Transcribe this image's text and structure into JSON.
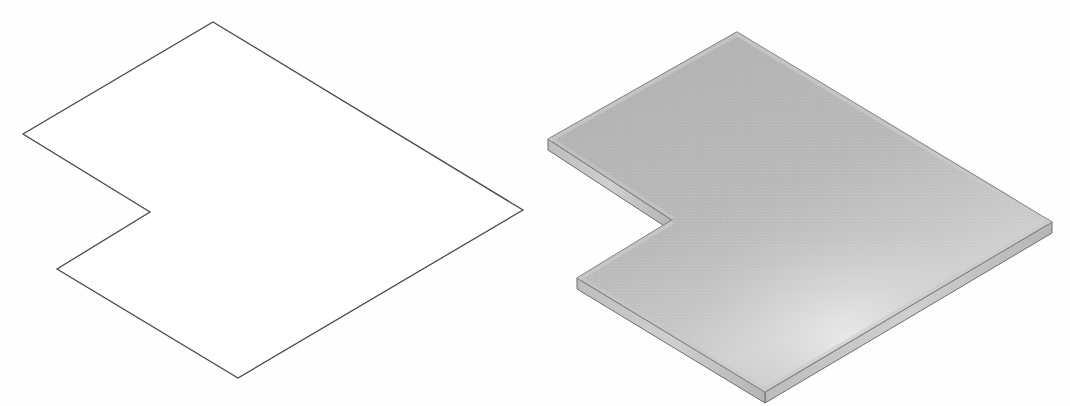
{
  "document": {
    "title": "L-shaped notched plate — outline and solid isometric views",
    "background_color": "#fefefe",
    "width": 1070,
    "height": 406
  },
  "figures": [
    {
      "id": "outline-view",
      "name": "wireframe-outline-plate",
      "caption": "",
      "render": "outline",
      "stroke_color": "#4a4a4a",
      "fill_color": "#ffffff",
      "stroke_width": 1.3,
      "vertices": [
        [
          213,
          22
        ],
        [
          523,
          210
        ],
        [
          238,
          378
        ],
        [
          57,
          269
        ],
        [
          150,
          212
        ],
        [
          23,
          134
        ]
      ]
    },
    {
      "id": "solid-view",
      "name": "shaded-solid-plate",
      "caption": "",
      "render": "solid",
      "top_face_color": "#b4b4b4",
      "top_face_highlight_color": "#d8d8d8",
      "edge_band_color": "#c9c9c9",
      "side_face_color": "#a0a0a0",
      "outline_color": "#6e6e6e",
      "thickness_px": 11,
      "vertices": [
        [
          737,
          32
        ],
        [
          1052,
          222
        ],
        [
          765,
          392
        ],
        [
          577,
          278
        ],
        [
          672,
          220
        ],
        [
          548,
          139
        ]
      ]
    }
  ],
  "geometry": {
    "shape_name": "notched hexagonal plate",
    "projection": "isometric",
    "vertex_count": 6,
    "notch": {
      "type": "V-notch",
      "location": "left side",
      "notch_vertices": [
        [
          57,
          269
        ],
        [
          150,
          212
        ],
        [
          23,
          134
        ]
      ]
    }
  },
  "colors": {
    "background": "#fefefe",
    "outline_stroke": "#4a4a4a",
    "solid_top": "#b4b4b4",
    "solid_highlight": "#d8d8d8",
    "solid_edge": "#c9c9c9",
    "solid_side": "#a0a0a0"
  }
}
